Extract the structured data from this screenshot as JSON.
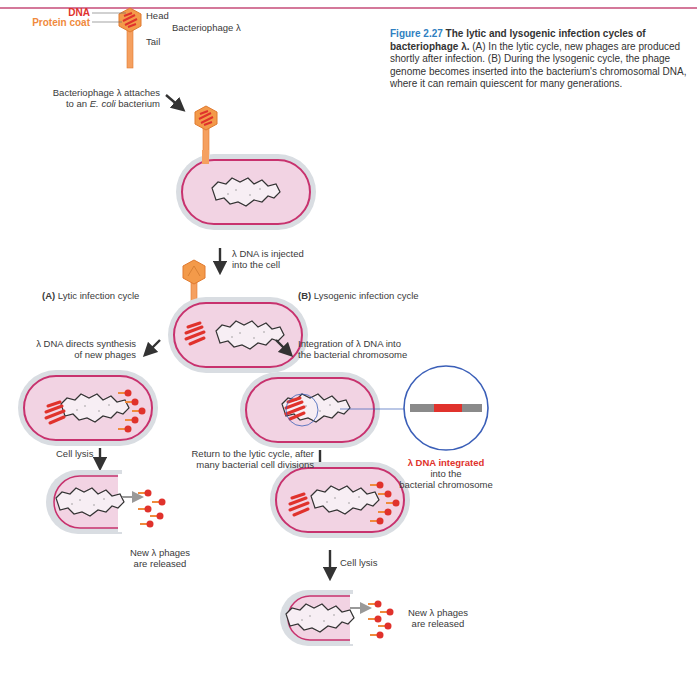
{
  "caption": {
    "figure_number": "Figure 2.27",
    "title": "The lytic and lysogenic infection cycles of bacteriophage λ.",
    "body": "(A) In the lytic cycle, new phages are produced shortly after infection. (B) During the lysogenic cycle, the phage genome becomes inserted into the bacterium's chromosomal DNA, where it can remain quiescent for many generations."
  },
  "phage_labels": {
    "dna": "DNA",
    "protein_coat": "Protein coat",
    "head": "Head",
    "tail": "Tail",
    "name": "Bacteriophage λ"
  },
  "steps": {
    "attach_line1": "Bacteriophage λ attaches",
    "attach_line2_prefix": "to an ",
    "attach_line2_italic": "E. coli",
    "attach_line2_suffix": " bacterium",
    "inject_line1": "λ DNA is injected",
    "inject_line2": "into the cell",
    "lytic_letter": "(A)",
    "lytic_title": "Lytic infection cycle",
    "lysogenic_letter": "(B)",
    "lysogenic_title": "Lysogenic infection cycle",
    "lytic_synth_line1": "λ DNA directs synthesis",
    "lytic_synth_line2": "of new phages",
    "integration_line1": "Integration of λ DNA into",
    "integration_line2": "the bacterial chromosome",
    "cell_lysis_a": "Cell lysis",
    "released_a_line1": "New λ phages",
    "released_a_line2": "are released",
    "return_line1": "Return to the lytic cycle, after",
    "return_line2": "many bacterial cell divisions",
    "integrated_line1": "λ DNA integrated",
    "integrated_line2": "into the",
    "integrated_line3": "bacterial chromosome",
    "cell_lysis_b": "Cell lysis",
    "released_b_line1": "New λ phages",
    "released_b_line2": "are released"
  },
  "colors": {
    "accent_line": "#d4789a",
    "figure_blue": "#2f7fc1",
    "dna_red": "#e0322c",
    "coat_orange": "#f08a3c",
    "cell_fill": "#f2d3e3",
    "cell_membrane": "#c8326e",
    "cell_wall": "#d9dde2",
    "magnifier_blue": "#3b5fb8"
  }
}
